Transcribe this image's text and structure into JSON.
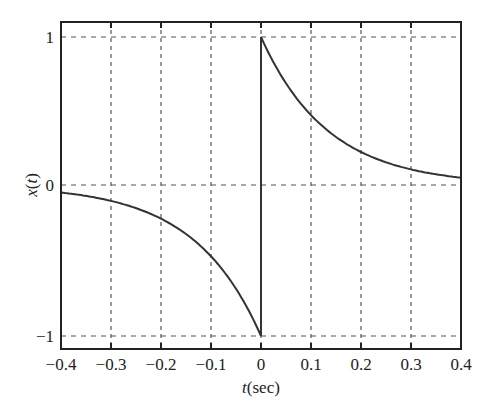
{
  "chart_data": {
    "type": "line",
    "title": "",
    "xlabel": "t (sec)",
    "xlabel_italic_part": "t",
    "xlabel_unit": "(sec)",
    "ylabel": "x(t)",
    "xlim": [
      -0.4,
      0.4
    ],
    "ylim": [
      -1.1,
      1.1
    ],
    "xticks": [
      -0.4,
      -0.3,
      -0.2,
      -0.1,
      0,
      0.1,
      0.2,
      0.3,
      0.4
    ],
    "xtick_labels": [
      "−0.4",
      "−0.3",
      "−0.2",
      "−0.1",
      "0",
      "0.1",
      "0.2",
      "0.3",
      "0.4"
    ],
    "yticks": [
      -1,
      0,
      1
    ],
    "ytick_labels": [
      "−1",
      "0",
      "1"
    ],
    "grid": true,
    "grid_style": "dashed",
    "legend": null,
    "series": [
      {
        "name": "x(t)",
        "description": "Odd exponential: -e^{7.5t} for t<0, e^{-7.5t} for t>0, jump from -1 to 1 at t=0",
        "x": [
          -0.4,
          -0.3,
          -0.2,
          -0.1,
          0,
          0,
          0.1,
          0.2,
          0.3,
          0.4
        ],
        "values": [
          -0.05,
          -0.105,
          -0.22,
          -0.47,
          -1,
          1,
          0.47,
          0.22,
          0.105,
          0.05
        ]
      }
    ],
    "color": "#333333"
  }
}
